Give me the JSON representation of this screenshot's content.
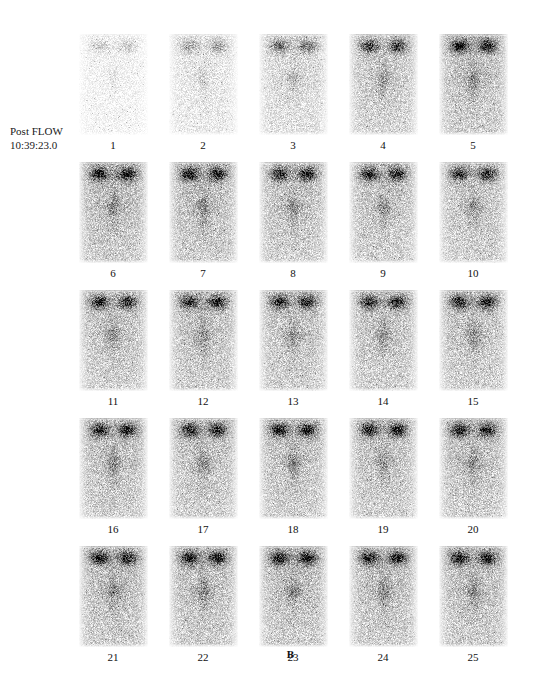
{
  "study": {
    "phase_label": "Post FLOW",
    "timestamp": "10:39:23.0"
  },
  "figure": {
    "caption": "B"
  },
  "grid": {
    "columns": 5,
    "rows": 5,
    "frame_count": 25
  },
  "frames": [
    {
      "number": "1",
      "intensity": 0.18
    },
    {
      "number": "2",
      "intensity": 0.34
    },
    {
      "number": "3",
      "intensity": 0.52
    },
    {
      "number": "4",
      "intensity": 0.74
    },
    {
      "number": "5",
      "intensity": 0.86
    },
    {
      "number": "6",
      "intensity": 0.9
    },
    {
      "number": "7",
      "intensity": 0.88
    },
    {
      "number": "8",
      "intensity": 0.84
    },
    {
      "number": "9",
      "intensity": 0.82
    },
    {
      "number": "10",
      "intensity": 0.8
    },
    {
      "number": "11",
      "intensity": 0.82
    },
    {
      "number": "12",
      "intensity": 0.84
    },
    {
      "number": "13",
      "intensity": 0.83
    },
    {
      "number": "14",
      "intensity": 0.82
    },
    {
      "number": "15",
      "intensity": 0.84
    },
    {
      "number": "16",
      "intensity": 0.85
    },
    {
      "number": "17",
      "intensity": 0.84
    },
    {
      "number": "18",
      "intensity": 0.86
    },
    {
      "number": "19",
      "intensity": 0.83
    },
    {
      "number": "20",
      "intensity": 0.85
    },
    {
      "number": "21",
      "intensity": 0.88
    },
    {
      "number": "22",
      "intensity": 0.87
    },
    {
      "number": "23",
      "intensity": 0.89
    },
    {
      "number": "24",
      "intensity": 0.86
    },
    {
      "number": "25",
      "intensity": 0.88
    }
  ],
  "colors": {
    "background": "#ffffff",
    "text": "#111111",
    "hot_spot": "#1a1a1a",
    "soft_tissue": "#9a9a9a"
  }
}
